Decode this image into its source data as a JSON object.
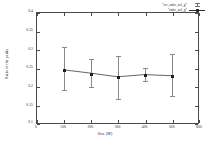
{
  "chart_data": {
    "type": "line",
    "title": "",
    "xlabel": "Size (M)",
    "ylabel": "Ratio of the peaks",
    "xlim": [
      0,
      600
    ],
    "ylim": [
      0.1,
      0.4
    ],
    "xticks": [
      0,
      100,
      200,
      300,
      400,
      500,
      600
    ],
    "xtick_labels": [
      "0",
      "100",
      "200",
      "300",
      "400",
      "500",
      "600"
    ],
    "yticks": [
      0.1,
      0.15,
      0.2,
      0.25,
      0.3,
      0.35,
      0.4
    ],
    "ytick_labels": [
      "0.1",
      "0.15",
      "0.2",
      "0.25",
      "0.3",
      "0.35",
      "0.4"
    ],
    "grid": false,
    "legend_position": "top-right",
    "x": [
      100,
      200,
      300,
      400,
      500
    ],
    "values": [
      0.245,
      0.236,
      0.226,
      0.232,
      0.229
    ],
    "yerr_low": [
      0.052,
      0.033,
      0.056,
      0.014,
      0.052
    ],
    "yerr_high": [
      0.063,
      0.041,
      0.059,
      0.02,
      0.06
    ],
    "series": [
      {
        "name": "\"err_ratio_sol_g\"",
        "style": "errorbars",
        "color": "#8a8a8a"
      },
      {
        "name": "\"ratio_sol_g\"",
        "style": "linespoints",
        "color": "#1f1f1f"
      }
    ]
  },
  "legend": {
    "entries": [
      {
        "label": "\"err_ratio_sol_g\""
      },
      {
        "label": "\"ratio_sol_g\""
      }
    ]
  }
}
